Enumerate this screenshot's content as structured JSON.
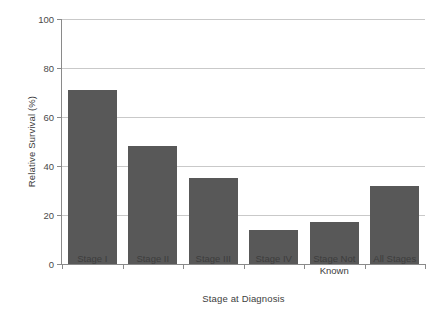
{
  "chart_data": {
    "type": "bar",
    "title": "",
    "xlabel": "Stage at Diagnosis",
    "ylabel": "Relative Survival (%)",
    "categories": [
      "Stage I",
      "Stage II",
      "Stage III",
      "Stage IV",
      "Stage Not Known",
      "All Stages"
    ],
    "values": [
      71,
      48,
      35,
      14,
      17,
      32
    ],
    "ylim": [
      0,
      100
    ],
    "yticks": [
      0,
      20,
      40,
      60,
      80,
      100
    ],
    "ytick_labels": [
      "0",
      "20",
      "40",
      "60",
      "80",
      "100"
    ],
    "grid": "horizontal",
    "legend": "none",
    "bar_color": "#585858",
    "gridline_color": "#c9c9c9",
    "axis_color": "#8a8a8a",
    "background": "#ffffff"
  },
  "categories_lines": [
    [
      "Stage I"
    ],
    [
      "Stage II"
    ],
    [
      "Stage III"
    ],
    [
      "Stage IV"
    ],
    [
      "Stage Not",
      "Known"
    ],
    [
      "All Stages"
    ]
  ]
}
